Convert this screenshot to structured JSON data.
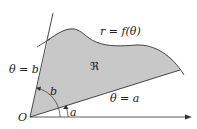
{
  "figure": {
    "colors": {
      "region_fill": "#c8c8c8",
      "stroke": "#333333",
      "background": "#ffffff"
    },
    "labels": {
      "curve": "r = f(θ)",
      "region": "ℜ",
      "ray_b": "θ = b",
      "ray_a": "θ = a",
      "angle_b": "b",
      "angle_a": "a",
      "origin": "O"
    }
  }
}
